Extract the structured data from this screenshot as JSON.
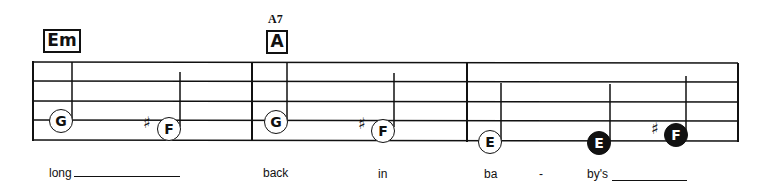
{
  "chords": [
    {
      "label": "Em",
      "alt": ""
    },
    {
      "label": "A",
      "alt": "A7"
    }
  ],
  "notes": [
    {
      "name": "G",
      "accidental": "",
      "filled": false
    },
    {
      "name": "F",
      "accidental": "♯",
      "filled": false
    },
    {
      "name": "G",
      "accidental": "",
      "filled": false
    },
    {
      "name": "F",
      "accidental": "♯",
      "filled": false
    },
    {
      "name": "E",
      "accidental": "",
      "filled": false
    },
    {
      "name": "E",
      "accidental": "",
      "filled": true
    },
    {
      "name": "F",
      "accidental": "♯",
      "filled": true
    }
  ],
  "lyrics": [
    "long",
    "back",
    "in",
    "ba",
    "-",
    "by's"
  ],
  "colors": {
    "ink": "#111111",
    "paper": "#ffffff"
  }
}
